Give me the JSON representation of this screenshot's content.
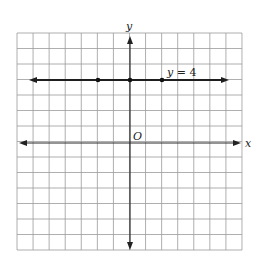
{
  "chart_data": {
    "type": "line",
    "title": "",
    "xlabel": "x",
    "ylabel": "y",
    "origin_label": "O",
    "xlim": [
      -8,
      7
    ],
    "ylim": [
      -7,
      7
    ],
    "grid": true,
    "grid_step": 1,
    "series": [
      {
        "name": "y = 4",
        "equation": "y = 4",
        "x": [
          -2,
          0,
          2
        ],
        "y": [
          4,
          4,
          4
        ],
        "marked_points": [
          [
            -2,
            4
          ],
          [
            0,
            4
          ],
          [
            2,
            4
          ]
        ],
        "arrows_both_ends": true
      }
    ],
    "annotations": [
      {
        "text": "y = 4",
        "x": 2.3,
        "y": 4.4
      }
    ]
  },
  "labels": {
    "x_axis": "x",
    "y_axis": "y",
    "origin": "O",
    "equation_left": "y",
    "equation_right": " = 4"
  }
}
